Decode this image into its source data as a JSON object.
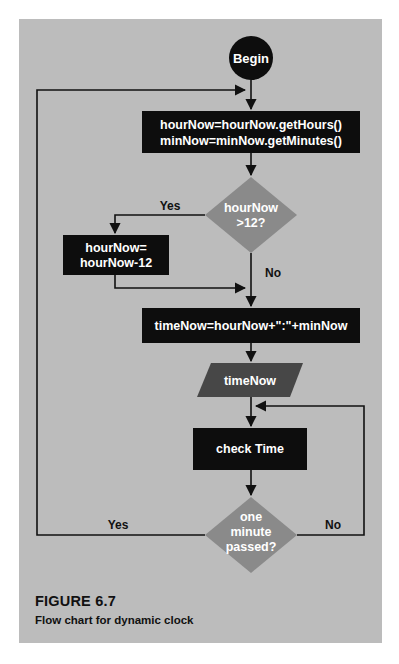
{
  "figure": {
    "title": "FIGURE 6.7",
    "caption": "Flow chart for dynamic clock"
  },
  "colors": {
    "background": "#bcbcbc",
    "process_fill": "#0d0d0d",
    "decision_fill": "#8a8a8a",
    "io_fill": "#474747",
    "line": "#111111",
    "text_on_shape": "#ffffff"
  },
  "nodes": {
    "begin": {
      "type": "terminal",
      "label": "Begin"
    },
    "get_time": {
      "type": "process",
      "line1": "hourNow=hourNow.getHours()",
      "line2": "minNow=minNow.getMinutes()"
    },
    "check_hour": {
      "type": "decision",
      "line1": "hourNow",
      "line2": ">12?"
    },
    "subtract": {
      "type": "process",
      "line1": "hourNow=",
      "line2": "hourNow-12"
    },
    "build_time": {
      "type": "process",
      "label": "timeNow=hourNow+\":\"+minNow"
    },
    "output_time": {
      "type": "io",
      "label": "timeNow"
    },
    "check_time": {
      "type": "process",
      "label": "check Time"
    },
    "minute_passed": {
      "type": "decision",
      "line1": "one",
      "line2": "minute",
      "line3": "passed?"
    }
  },
  "edges": {
    "hour_yes": "Yes",
    "hour_no": "No",
    "minute_yes": "Yes",
    "minute_no": "No"
  }
}
